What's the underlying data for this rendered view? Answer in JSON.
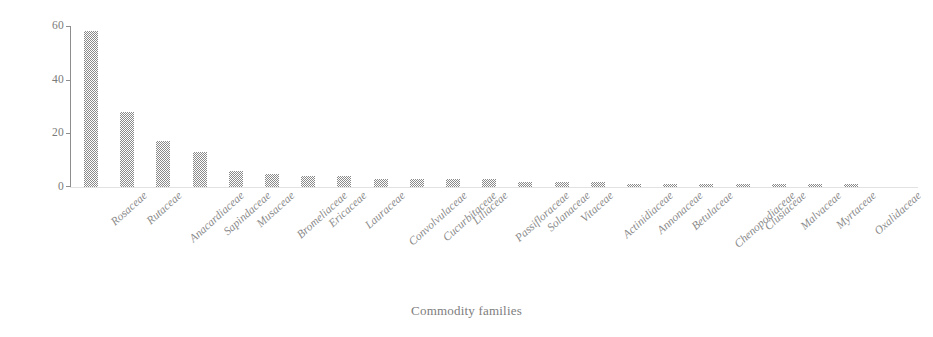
{
  "chart_data": {
    "type": "bar",
    "title": "",
    "subtitle": "",
    "xlabel": "Commodity families",
    "ylabel": "",
    "ylim": [
      0,
      60
    ],
    "yticks": [
      0,
      20,
      40,
      60
    ],
    "grid": false,
    "legend": null,
    "bar_color": "#8a8a8a",
    "categories": [
      "Rosaceae",
      "Rutaceae",
      "Anacardiaceae",
      "Sapindaceae",
      "Musaceae",
      "Bromeliaceae",
      "Ericaceae",
      "Lauraceae",
      "Convolvulaceae",
      "Cucurbitaceae",
      "Liliaceae",
      "Passifloraceae",
      "Solanaceae",
      "Vitaceae",
      "Actinidiaceae",
      "Annonaceae",
      "Betulaceae",
      "Chenopodiaceae",
      "Clusiaceae",
      "Malvaceae",
      "Myrtaceae",
      "Oxalidaceae"
    ],
    "values": [
      58,
      28,
      17,
      13,
      6,
      5,
      4,
      4,
      3,
      3,
      3,
      3,
      2,
      2,
      2,
      1,
      1,
      1,
      1,
      1,
      1,
      1
    ]
  },
  "axis": {
    "x_title": "Commodity families",
    "y_tick_labels": [
      "60",
      "40",
      "20",
      "0"
    ]
  }
}
